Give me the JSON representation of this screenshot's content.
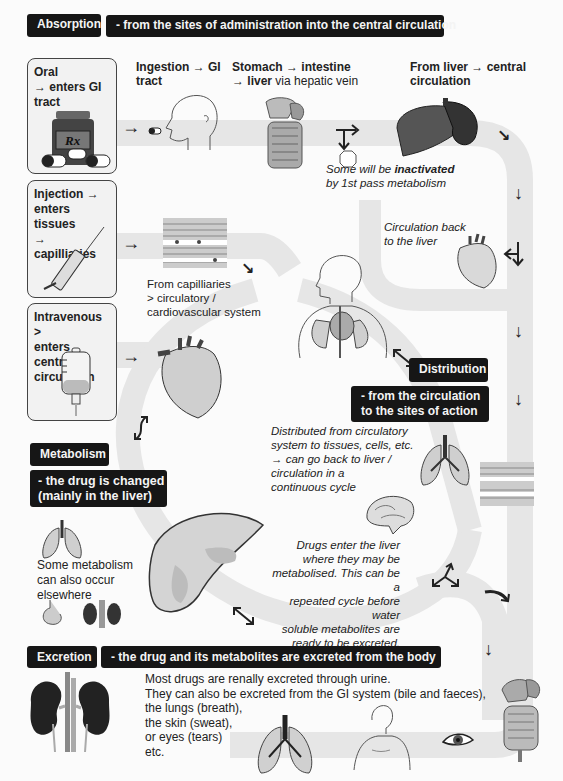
{
  "absorption": {
    "title": "Absorption",
    "subtitle": "- from the sites of administration into the central circulation"
  },
  "routes": [
    {
      "id": "oral",
      "lines": [
        "Oral",
        "→ enters GI",
        "tract"
      ],
      "icon": "pill-bottle-icon"
    },
    {
      "id": "injection",
      "lines": [
        "Injection →",
        "enters tissues",
        "→ capilliaries"
      ],
      "icon": "syringe-icon"
    },
    {
      "id": "intravenous",
      "lines": [
        "Intravenous >",
        "enters central",
        "circulation"
      ],
      "icon": "iv-bag-icon"
    }
  ],
  "steps": {
    "ingestion": [
      "Ingestion → GI",
      "tract"
    ],
    "stomach": {
      "line1": "Stomach → intestine",
      "line2_bold": "→ liver",
      "line2_rest": " via hepatic vein"
    },
    "from_liver": [
      "From liver → central",
      "circulation"
    ],
    "inactivated": {
      "pre": "Some will be ",
      "bold": "inactivated",
      "line2": "by 1st pass metabolism"
    },
    "circulation_back": [
      "Circulation back",
      "to the liver"
    ],
    "capillaries": [
      "From capilliaries",
      "> circulatory /",
      "cardiovascular system"
    ]
  },
  "distribution": {
    "title": "Distribution",
    "subtitle": [
      "- from the circulation",
      "to the sites of action"
    ],
    "note": [
      "Distributed from circulatory",
      "system to tissues, cells, etc.",
      "→ can go back to liver /",
      "circulation in a",
      "continuous cycle"
    ]
  },
  "metabolism": {
    "title": "Metabolism",
    "subtitle": [
      "- the drug is changed",
      "(mainly in the liver)"
    ],
    "elsewhere": [
      "Some metabolism",
      "can also occur",
      "elsewhere"
    ],
    "liver_note": [
      "Drugs enter the liver",
      "where they may be",
      "metabolised. This can be a",
      "repeated cycle before water",
      "soluble metabolites are",
      "ready to be excreted."
    ]
  },
  "excretion": {
    "title": "Excretion",
    "subtitle": "- the drug and its metabolites are excreted from the body",
    "body": [
      "Most drugs are renally excreted through urine.",
      "They can also be excreted from the GI system (bile and faeces),",
      "the lungs (breath),",
      "the skin (sweat),",
      "or eyes (tears)",
      "etc."
    ]
  },
  "arrows": {
    "right": "→",
    "down": "↓",
    "diag_down_right": "↘"
  },
  "colors": {
    "banner_bg": "#161616",
    "banner_text": "#f4f4f4",
    "pathway_band": "#e6e6e6",
    "route_box_bg": "#f2f2f2"
  }
}
